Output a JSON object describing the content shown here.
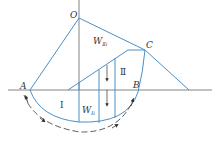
{
  "diagram": {
    "type": "slope-stability-slip-circle",
    "colors": {
      "outline": "#4a90c8",
      "axis": "#555555",
      "text": "#333333"
    },
    "points": {
      "O": "O",
      "A": "A",
      "B": "B",
      "C": "C"
    },
    "regions": {
      "region_1": "Ⅰ",
      "region_2": "Ⅱ"
    },
    "weights": {
      "w1": {
        "base": "W",
        "sub": "Ⅰi"
      },
      "w2": {
        "base": "W",
        "sub": "Ⅱi"
      }
    }
  }
}
